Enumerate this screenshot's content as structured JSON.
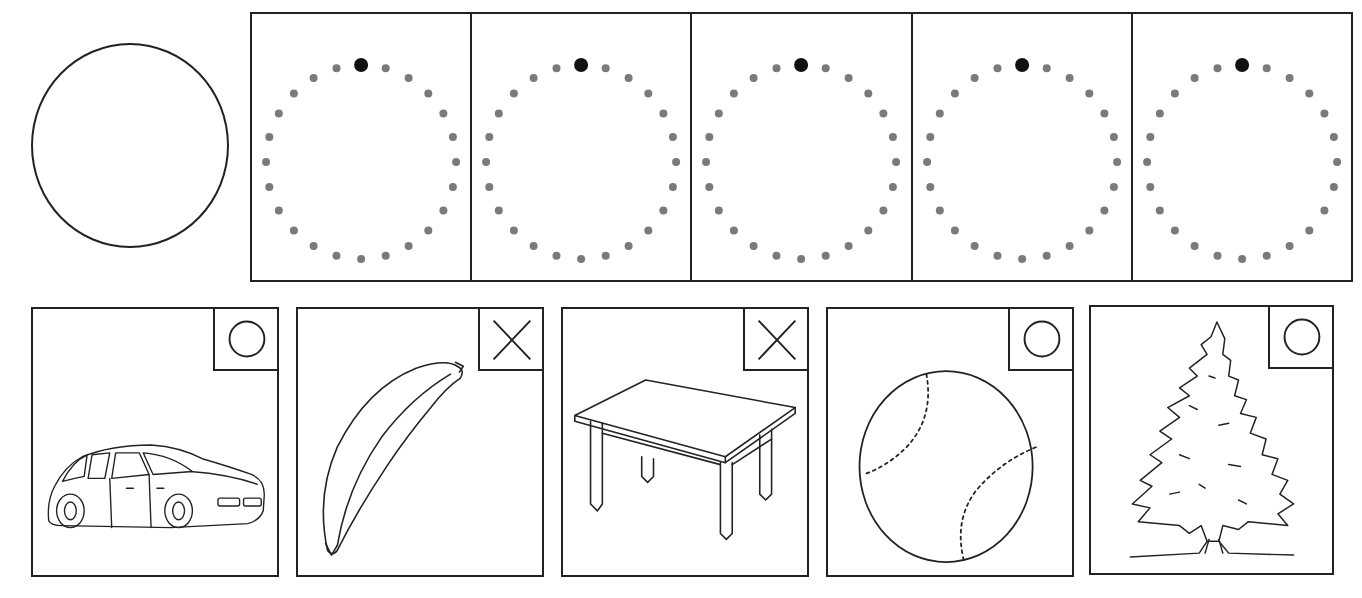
{
  "worksheet": {
    "example_shape": "circle",
    "tracing": {
      "panels": [
        {
          "shape": "circle",
          "dot_count": 24,
          "start_dot": "top"
        },
        {
          "shape": "circle",
          "dot_count": 24,
          "start_dot": "top"
        },
        {
          "shape": "circle",
          "dot_count": 24,
          "start_dot": "top"
        },
        {
          "shape": "circle",
          "dot_count": 24,
          "start_dot": "top"
        },
        {
          "shape": "circle",
          "dot_count": 24,
          "start_dot": "top"
        }
      ],
      "colors": {
        "dot": "#7a7a7a",
        "start_dot": "#111111",
        "border": "#222222"
      }
    },
    "cards": [
      {
        "object": "car",
        "icon": "car-icon",
        "mark": "O",
        "mark_meaning": "round/correct"
      },
      {
        "object": "banana",
        "icon": "banana-icon",
        "mark": "X",
        "mark_meaning": "not round/incorrect"
      },
      {
        "object": "table",
        "icon": "table-icon",
        "mark": "X",
        "mark_meaning": "not round/incorrect"
      },
      {
        "object": "baseball",
        "icon": "baseball-icon",
        "mark": "O",
        "mark_meaning": "round/correct"
      },
      {
        "object": "tree",
        "icon": "tree-icon",
        "mark": "O",
        "mark_meaning": "round/correct"
      }
    ]
  }
}
